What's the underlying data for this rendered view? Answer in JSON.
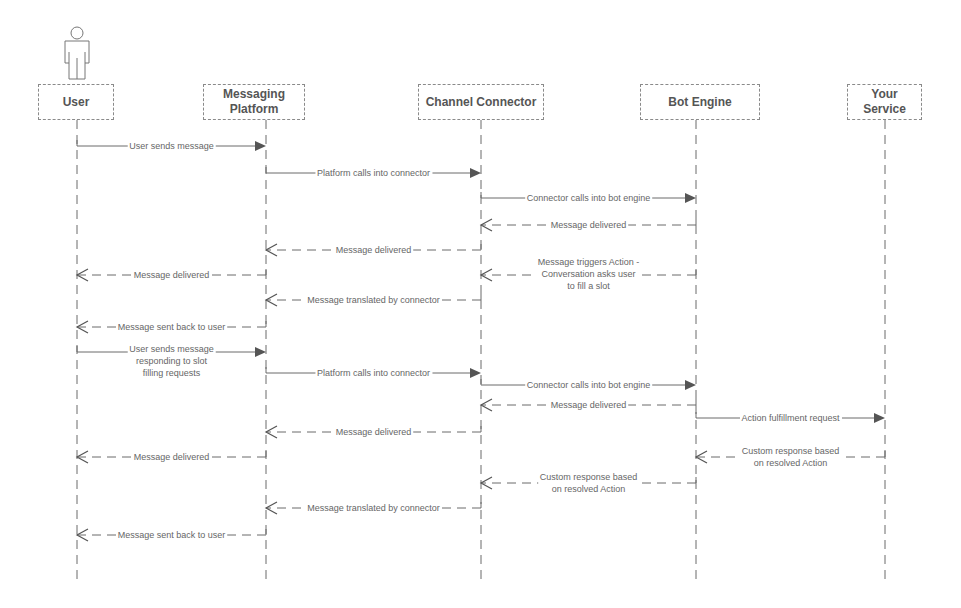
{
  "participants": [
    {
      "id": "user",
      "label": "User",
      "x": 77,
      "box": [
        38,
        84,
        76,
        36
      ],
      "actor": true
    },
    {
      "id": "messaging-platform",
      "label": "Messaging\nPlatform",
      "label_lines": [
        "Messaging",
        "Platform"
      ],
      "x": 266,
      "box": [
        203,
        84,
        102,
        36
      ]
    },
    {
      "id": "channel-connector",
      "label": "Channel Connector",
      "x": 481,
      "box": [
        418,
        84,
        126,
        36
      ]
    },
    {
      "id": "bot-engine",
      "label": "Bot Engine",
      "x": 696,
      "box": [
        640,
        84,
        120,
        36
      ]
    },
    {
      "id": "your-service",
      "label": "Your\nService",
      "label_lines": [
        "Your",
        "Service"
      ],
      "x": 885,
      "box": [
        847,
        84,
        75,
        36
      ]
    }
  ],
  "lifeline_end_y": 582,
  "messages": [
    {
      "from": "user",
      "to": "messaging-platform",
      "y": 146,
      "type": "sync",
      "label": "User sends message"
    },
    {
      "from": "messaging-platform",
      "to": "channel-connector",
      "y": 173,
      "type": "sync",
      "label": "Platform calls into connector"
    },
    {
      "from": "channel-connector",
      "to": "bot-engine",
      "y": 198,
      "type": "sync",
      "label": "Connector calls into bot engine"
    },
    {
      "from": "bot-engine",
      "to": "channel-connector",
      "y": 225,
      "type": "return",
      "label": "Message delivered"
    },
    {
      "from": "channel-connector",
      "to": "messaging-platform",
      "y": 250,
      "type": "return",
      "label": "Message delivered"
    },
    {
      "from": "messaging-platform",
      "to": "user",
      "y": 275,
      "type": "return",
      "label": "Message delivered"
    },
    {
      "from": "bot-engine",
      "to": "channel-connector",
      "y": 275,
      "type": "return",
      "label": "Message triggers Action - Conversation asks user to fill a slot",
      "label_lines": [
        "Message triggers Action -",
        "Conversation asks user",
        "to fill a slot"
      ]
    },
    {
      "from": "channel-connector",
      "to": "messaging-platform",
      "y": 300,
      "type": "return",
      "label": "Message translated by connector"
    },
    {
      "from": "messaging-platform",
      "to": "user",
      "y": 327,
      "type": "return",
      "label": "Message sent back to user"
    },
    {
      "from": "user",
      "to": "messaging-platform",
      "y": 352,
      "type": "sync",
      "label": "User sends message responding to slot filling requests",
      "label_lines": [
        "User sends message",
        "responding to slot",
        "filling requests"
      ]
    },
    {
      "from": "messaging-platform",
      "to": "channel-connector",
      "y": 373,
      "type": "sync",
      "label": "Platform calls into connector"
    },
    {
      "from": "channel-connector",
      "to": "bot-engine",
      "y": 385,
      "type": "sync",
      "label": "Connector calls into bot engine"
    },
    {
      "from": "bot-engine",
      "to": "channel-connector",
      "y": 405,
      "type": "return",
      "label": "Message delivered"
    },
    {
      "from": "bot-engine",
      "to": "your-service",
      "y": 418,
      "type": "sync",
      "label": "Action fulfillment request"
    },
    {
      "from": "channel-connector",
      "to": "messaging-platform",
      "y": 432,
      "type": "return",
      "label": "Message delivered"
    },
    {
      "from": "messaging-platform",
      "to": "user",
      "y": 457,
      "type": "return",
      "label": "Message delivered"
    },
    {
      "from": "your-service",
      "to": "bot-engine",
      "y": 457,
      "type": "return",
      "label": "Custom response based on resolved Action",
      "label_lines": [
        "Custom response based",
        "on resolved Action"
      ]
    },
    {
      "from": "bot-engine",
      "to": "channel-connector",
      "y": 483,
      "type": "return",
      "label": "Custom response based on resolved Action",
      "label_lines": [
        "Custom response based",
        "on resolved Action"
      ]
    },
    {
      "from": "channel-connector",
      "to": "messaging-platform",
      "y": 508,
      "type": "return",
      "label": "Message translated by connector"
    },
    {
      "from": "messaging-platform",
      "to": "user",
      "y": 535,
      "type": "return",
      "label": "Message sent back to user"
    }
  ],
  "colors": {
    "line": "#6a6a6a",
    "arrowhead": "#555555",
    "text": "#666666",
    "box_border": "#8a8a8a"
  }
}
